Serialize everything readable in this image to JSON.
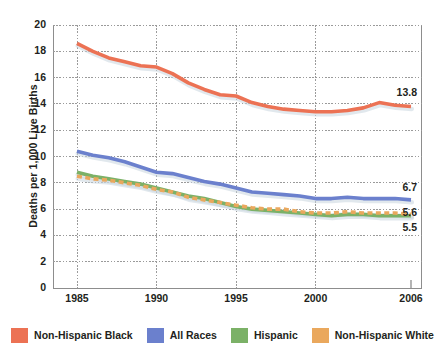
{
  "chart_data": {
    "type": "line",
    "title": "",
    "xlabel": "",
    "ylabel": "Deaths per 1,000 Live Births",
    "xlim": [
      1985,
      2006
    ],
    "ylim": [
      0,
      20
    ],
    "grid": true,
    "legend_position": "bottom",
    "x": [
      1985,
      1986,
      1987,
      1988,
      1989,
      1990,
      1991,
      1992,
      1993,
      1994,
      1995,
      1996,
      1997,
      1998,
      1999,
      2000,
      2001,
      2002,
      2003,
      2004,
      2005,
      2006
    ],
    "xticks": [
      "1985",
      "1990",
      "1995",
      "2000",
      "2006"
    ],
    "xtick_values": [
      1985,
      1990,
      1995,
      2000,
      2006
    ],
    "yticks": [
      "0",
      "2",
      "4",
      "6",
      "8",
      "10",
      "12",
      "14",
      "16",
      "18",
      "20"
    ],
    "ytick_values": [
      0,
      2,
      4,
      6,
      8,
      10,
      12,
      14,
      16,
      18,
      20
    ],
    "series": [
      {
        "name": "Non-Hispanic Black",
        "color": "#ec7254",
        "style": "solid",
        "values": [
          18.6,
          18.0,
          17.5,
          17.2,
          16.9,
          16.8,
          16.3,
          15.6,
          15.1,
          14.7,
          14.6,
          14.1,
          13.8,
          13.6,
          13.5,
          13.4,
          13.4,
          13.5,
          13.7,
          14.1,
          13.9,
          13.8
        ],
        "end_label": "13.8"
      },
      {
        "name": "All Races",
        "color": "#6b80cd",
        "style": "solid",
        "values": [
          10.4,
          10.1,
          9.9,
          9.6,
          9.2,
          8.8,
          8.7,
          8.4,
          8.1,
          7.9,
          7.6,
          7.3,
          7.2,
          7.1,
          7.0,
          6.8,
          6.8,
          6.9,
          6.8,
          6.8,
          6.8,
          6.7
        ],
        "end_label": "6.7"
      },
      {
        "name": "Hispanic",
        "color": "#7bb167",
        "style": "solid",
        "values": [
          8.8,
          8.5,
          8.3,
          8.1,
          7.9,
          7.6,
          7.3,
          7.0,
          6.8,
          6.5,
          6.2,
          6.0,
          5.9,
          5.8,
          5.7,
          5.6,
          5.5,
          5.6,
          5.6,
          5.5,
          5.5,
          5.5
        ],
        "end_label": "5.5"
      },
      {
        "name": "Non-Hispanic White",
        "color": "#eaa85d",
        "style": "dashed",
        "values": [
          8.5,
          8.3,
          8.2,
          8.0,
          7.8,
          7.5,
          7.3,
          6.9,
          6.7,
          6.5,
          6.3,
          6.1,
          6.0,
          6.0,
          5.8,
          5.7,
          5.7,
          5.8,
          5.7,
          5.7,
          5.7,
          5.6
        ],
        "end_label": "5.6"
      }
    ],
    "end_labels": [
      {
        "text": "13.8",
        "value": 13.8,
        "series": "Non-Hispanic Black"
      },
      {
        "text": "6.7",
        "value": 6.7,
        "series": "All Races"
      },
      {
        "text": "5.6",
        "value": 5.6,
        "series": "Non-Hispanic White"
      },
      {
        "text": "5.5",
        "value": 5.5,
        "series": "Hispanic"
      }
    ]
  },
  "axis": {
    "y_title": "Deaths per 1,000 Live Births"
  },
  "legend": {
    "items": [
      {
        "label": "Non-Hispanic Black",
        "color": "#ec7254"
      },
      {
        "label": "All Races",
        "color": "#6b80cd"
      },
      {
        "label": "Hispanic",
        "color": "#7bb167"
      },
      {
        "label": "Non-Hispanic White",
        "color": "#eaa85d"
      }
    ]
  },
  "colors": {
    "axis": "#8d8d8d",
    "grid": "#9a9a9a",
    "text": "#231f20",
    "background": "#ffffff"
  }
}
